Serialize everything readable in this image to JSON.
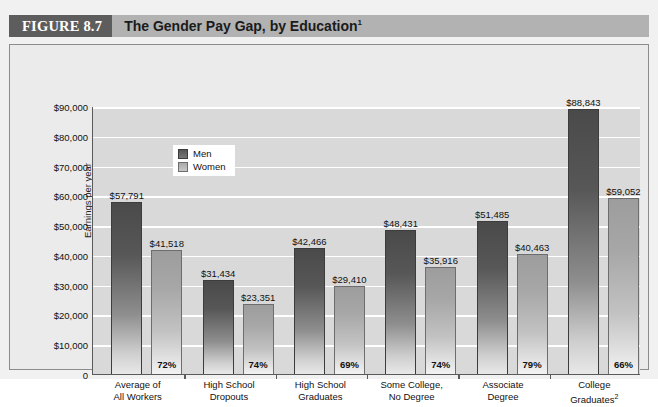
{
  "figure": {
    "number_label": "FIGURE 8.7",
    "title": "The Gender Pay Gap, by Education",
    "title_superscript": "1"
  },
  "legend": {
    "position": "inside-top-left",
    "items": [
      {
        "key": "men",
        "label": "Men",
        "color": "#575757"
      },
      {
        "key": "women",
        "label": "Women",
        "color": "#a7a7a7"
      }
    ]
  },
  "axes": {
    "ylabel": "Earnings per year",
    "ytick_labels": [
      "$90,000",
      "$80,000",
      "$70,000",
      "$60,000",
      "$50,000",
      "$40,000",
      "$30,000",
      "$20,000",
      "$10,000",
      "0"
    ],
    "ytick_values": [
      90000,
      80000,
      70000,
      60000,
      50000,
      40000,
      30000,
      20000,
      10000,
      0
    ]
  },
  "chart_data": {
    "type": "bar",
    "title": "The Gender Pay Gap, by Education",
    "xlabel": "",
    "ylabel": "Earnings per year",
    "ylim": [
      0,
      90000
    ],
    "grid": true,
    "legend_position": "inside-top-left",
    "categories": [
      "Average of All Workers",
      "High School Dropouts",
      "High School Graduates",
      "Some College, No Degree",
      "Associate Degree",
      "College Graduates"
    ],
    "category_lines": [
      [
        "Average of",
        "All Workers"
      ],
      [
        "High School",
        "Dropouts"
      ],
      [
        "High School",
        "Graduates"
      ],
      [
        "Some College,",
        "No Degree"
      ],
      [
        "Associate",
        "Degree"
      ],
      [
        "College",
        "Graduates"
      ]
    ],
    "category_superscripts": [
      "",
      "",
      "",
      "",
      "",
      "2"
    ],
    "series": [
      {
        "name": "Men",
        "values": [
          57791,
          31434,
          42466,
          48431,
          51485,
          88843
        ],
        "labels": [
          "$57,791",
          "$31,434",
          "$42,466",
          "$48,431",
          "$51,485",
          "$88,843"
        ]
      },
      {
        "name": "Women",
        "values": [
          41518,
          23351,
          29410,
          35916,
          40463,
          59052
        ],
        "labels": [
          "$41,518",
          "$23,351",
          "$29,410",
          "$35,916",
          "$40,463",
          "$59,052"
        ]
      }
    ],
    "ratio_labels": [
      "72%",
      "74%",
      "69%",
      "74%",
      "79%",
      "66%"
    ]
  }
}
